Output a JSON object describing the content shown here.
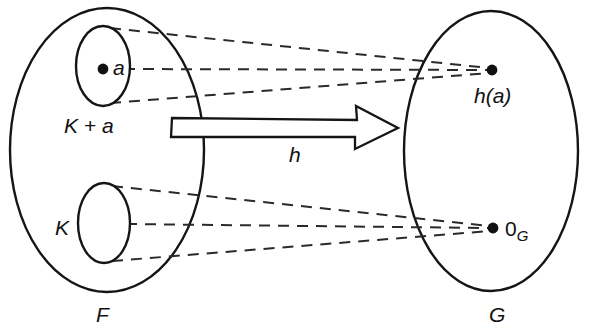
{
  "diagram": {
    "stroke_color": "#151515",
    "dash_color": "#2a2a2a",
    "background": "#ffffff",
    "domain_set": {
      "label": "F",
      "label_position": {
        "x": 96,
        "y": 322
      },
      "ellipse": {
        "cx": 107,
        "cy": 150,
        "rx": 97,
        "ry": 142
      }
    },
    "codomain_set": {
      "label": "G",
      "label_position": {
        "x": 489,
        "y": 322
      },
      "ellipse": {
        "cx": 491,
        "cy": 151,
        "rx": 87,
        "ry": 140
      }
    },
    "coset_subset": {
      "label": "K + a",
      "label_position": {
        "x": 64,
        "y": 133
      },
      "ellipse": {
        "cx": 103,
        "cy": 66,
        "rx": 27,
        "ry": 40
      },
      "point_label": "a",
      "point": {
        "x": 103,
        "y": 69
      },
      "point_label_position": {
        "x": 113,
        "y": 75
      }
    },
    "kernel_subset": {
      "label": "K",
      "label_position": {
        "x": 55,
        "y": 235
      },
      "ellipse": {
        "cx": 104,
        "cy": 223,
        "rx": 26,
        "ry": 40
      }
    },
    "image_point": {
      "label": "h(a)",
      "point": {
        "x": 492,
        "y": 70
      },
      "label_position": {
        "x": 474,
        "y": 103
      }
    },
    "identity_point": {
      "label": "0",
      "subscript": "G",
      "point": {
        "x": 493,
        "y": 228
      },
      "label_position": {
        "x": 505,
        "y": 236
      }
    },
    "map_arrow": {
      "label": "h",
      "label_position": {
        "x": 289,
        "y": 162
      },
      "start": {
        "x": 172,
        "y": 115
      },
      "end": {
        "x": 396,
        "y": 128
      },
      "shaft_top_y": 118,
      "shaft_bottom_y": 137,
      "head_start_x": 355,
      "head_top_y": 106,
      "head_bottom_y": 149,
      "tip_x": 398
    },
    "correspondence_lines": [
      {
        "from": {
          "x": 110,
          "y": 28
        },
        "to": {
          "x": 489,
          "y": 68
        },
        "name": "coset-top-to-image"
      },
      {
        "from": {
          "x": 124,
          "y": 69
        },
        "to": {
          "x": 489,
          "y": 70
        },
        "name": "coset-point-to-image"
      },
      {
        "from": {
          "x": 110,
          "y": 103
        },
        "to": {
          "x": 489,
          "y": 73
        },
        "name": "coset-bottom-to-image"
      },
      {
        "from": {
          "x": 112,
          "y": 186
        },
        "to": {
          "x": 490,
          "y": 226
        },
        "name": "kernel-top-to-identity"
      },
      {
        "from": {
          "x": 126,
          "y": 224
        },
        "to": {
          "x": 490,
          "y": 228
        },
        "name": "kernel-mid-to-identity"
      },
      {
        "from": {
          "x": 112,
          "y": 261
        },
        "to": {
          "x": 490,
          "y": 231
        },
        "name": "kernel-bottom-to-identity"
      }
    ]
  }
}
